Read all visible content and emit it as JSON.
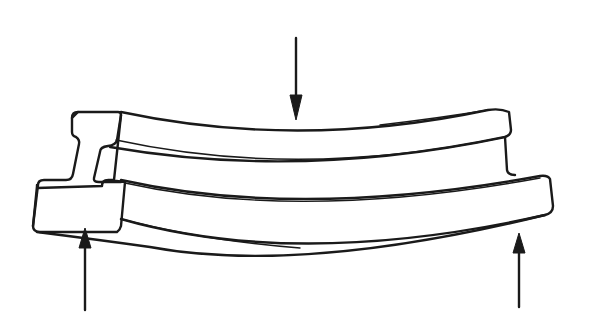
{
  "figure": {
    "forces": [
      {
        "name": "applied-load",
        "direction": "down",
        "position": "center-top"
      },
      {
        "name": "left-support-reaction",
        "direction": "up",
        "position": "left-bottom"
      },
      {
        "name": "right-support-reaction",
        "direction": "up",
        "position": "right-bottom"
      }
    ],
    "colors": {
      "line": "#1a1a1a",
      "background": "#ffffff"
    }
  }
}
